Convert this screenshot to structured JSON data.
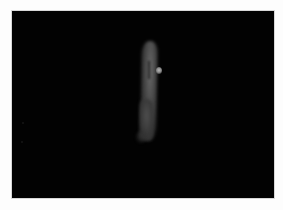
{
  "image": {
    "description": "Fluorescence microscopy image: single elongated cell glowing grey on black background with a small bright punctum on its right side",
    "frame": {
      "background_color": "#020202",
      "border_color": "#d8d8d8"
    },
    "subject": {
      "type": "elongated-cell",
      "color": "#4a4a4a",
      "punctum_color": "#b8b8b8"
    }
  }
}
